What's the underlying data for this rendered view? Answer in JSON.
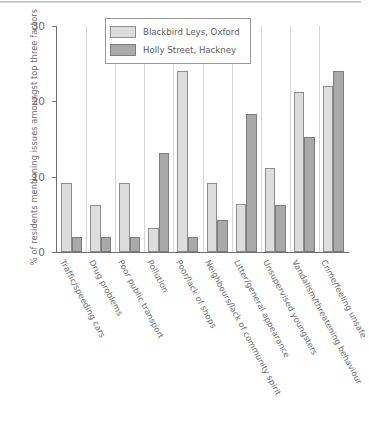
{
  "chart_data": {
    "type": "bar",
    "title": "",
    "subtitle": "",
    "xlabel": "",
    "ylabel": "% of residents mentioning issues amoungst top three factors",
    "ylim": [
      0,
      30
    ],
    "yticks": [
      0,
      10,
      20,
      30
    ],
    "grid": "vertical category separators only",
    "legend_position": "top-center inside plot",
    "categories": [
      "Traffic/speeding cars",
      "Drug problems",
      "Poor public transport",
      "Pollution",
      "Poor/lack of shops",
      "Neighbours/lack of community spirit",
      "Litter/general appearance",
      "Unsupervised youngsters",
      "Vandalism/threatening behaviour",
      "Crime/feeling unsafe"
    ],
    "series": [
      {
        "name": "Blackbird Leys, Oxford",
        "color": "#dddddd",
        "values": [
          9.2,
          6.2,
          9.2,
          3.2,
          24.0,
          9.2,
          6.4,
          11.2,
          21.2,
          22.0
        ]
      },
      {
        "name": "Holly Street, Hackney",
        "color": "#a9a9a9",
        "values": [
          2.0,
          2.0,
          2.0,
          13.2,
          2.0,
          4.3,
          18.3,
          6.3,
          15.3,
          24.0
        ]
      }
    ]
  },
  "legend": {
    "entries": [
      {
        "label": "Blackbird Leys, Oxford"
      },
      {
        "label": "Holly Street, Hackney"
      }
    ]
  }
}
